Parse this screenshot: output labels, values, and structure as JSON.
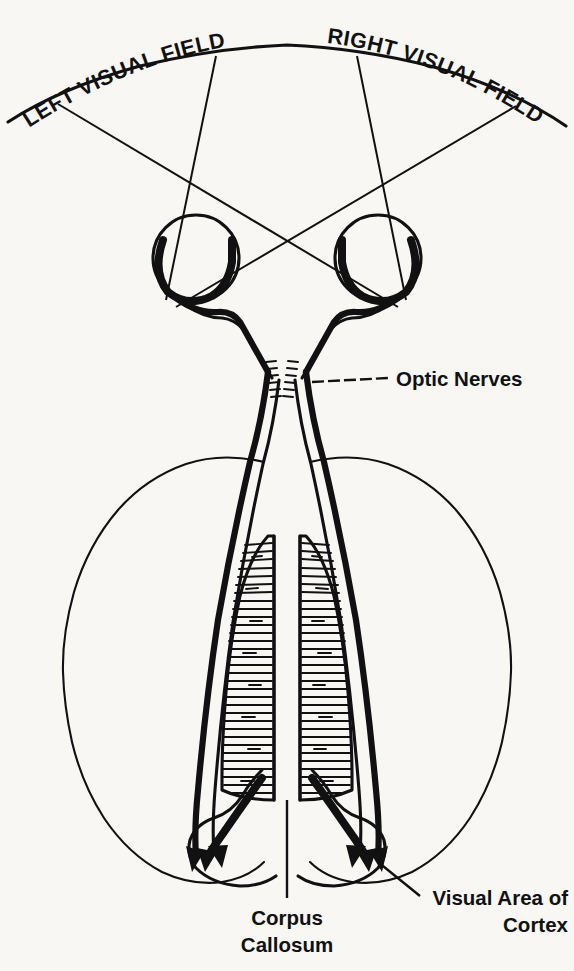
{
  "figure": {
    "background_color": "#f8f7f4",
    "ink_color": "#111111",
    "width": 574,
    "height": 971
  },
  "labels": {
    "left_visual_field": "LEFT VISUAL FIELD",
    "right_visual_field": "RIGHT VISUAL FIELD",
    "optic_nerves": "Optic Nerves",
    "corpus_callosum_line1": "Corpus",
    "corpus_callosum_line2": "Callosum",
    "visual_cortex_line1": "Visual Area of",
    "visual_cortex_line2": "Cortex"
  },
  "parts": {
    "visual_field_arc": "visual-field-arc",
    "left_eye": "left-eye",
    "right_eye": "right-eye",
    "optic_chiasm": "optic-chiasm",
    "corpus_callosum": "corpus-callosum",
    "left_hemisphere": "left-hemisphere",
    "right_hemisphere": "right-hemisphere",
    "left_occipital_lobe": "left-occipital-lobe",
    "right_occipital_lobe": "right-occipital-lobe"
  }
}
